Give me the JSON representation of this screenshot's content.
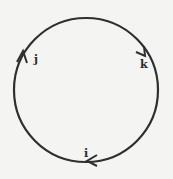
{
  "diagram": {
    "type": "cycle",
    "stroke_color": "#2f2f2f",
    "background_color": "#f4f4f2",
    "nodes": [
      {
        "id": "j",
        "label": "j",
        "position": "upper-left"
      },
      {
        "id": "k",
        "label": "k",
        "position": "upper-right"
      },
      {
        "id": "i",
        "label": "i",
        "position": "bottom"
      }
    ],
    "edges": [
      {
        "from": "j",
        "to": "k",
        "direction": "clockwise"
      },
      {
        "from": "k",
        "to": "i",
        "direction": "clockwise"
      },
      {
        "from": "i",
        "to": "j",
        "direction": "clockwise"
      }
    ]
  }
}
